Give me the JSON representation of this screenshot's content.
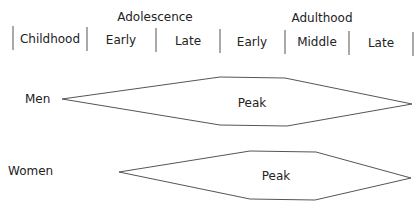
{
  "header": {
    "groups": [
      {
        "label": "Adolescence",
        "x": 155,
        "y": 10
      },
      {
        "label": "Adulthood",
        "x": 322,
        "y": 11
      }
    ],
    "stages": [
      {
        "label": "Childhood",
        "x": 50,
        "y": 32
      },
      {
        "label": "Early",
        "x": 121,
        "y": 33
      },
      {
        "label": "Late",
        "x": 188,
        "y": 34
      },
      {
        "label": "Early",
        "x": 252,
        "y": 35
      },
      {
        "label": "Middle",
        "x": 317,
        "y": 35
      },
      {
        "label": "Late",
        "x": 381,
        "y": 36
      }
    ],
    "dividers": [
      {
        "x": 13,
        "y1": 26,
        "y2": 50
      },
      {
        "x": 87,
        "y1": 27,
        "y2": 51
      },
      {
        "x": 156,
        "y1": 28,
        "y2": 52
      },
      {
        "x": 220,
        "y1": 29,
        "y2": 53
      },
      {
        "x": 285,
        "y1": 30,
        "y2": 54
      },
      {
        "x": 349,
        "y1": 31,
        "y2": 55
      },
      {
        "x": 413,
        "y1": 32,
        "y2": 56
      }
    ]
  },
  "rows": [
    {
      "label": "Men",
      "label_x": 25,
      "label_y": 92,
      "shape_label": "Peak",
      "shape_label_x": 252,
      "shape_label_y": 96,
      "points": "62,99 220,77 285,78 412,104 287,126 220,125"
    },
    {
      "label": "Women",
      "label_x": 8,
      "label_y": 164,
      "shape_label": "Peak",
      "shape_label_x": 276,
      "shape_label_y": 169,
      "points": "119,172 250,151 316,152 411,178 315,200 250,199"
    }
  ],
  "colors": {
    "line": "#555555",
    "text": "#222222"
  }
}
